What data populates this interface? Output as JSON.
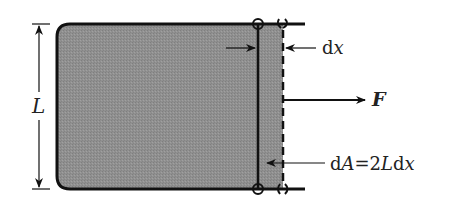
{
  "diagram": {
    "labels": {
      "length": "L",
      "displacement": "dx",
      "force": "F",
      "area_change": "dA=2Ldx"
    },
    "colors": {
      "film_fill": "#8f8f8f",
      "stroke": "#111111",
      "background": "#ffffff"
    }
  }
}
